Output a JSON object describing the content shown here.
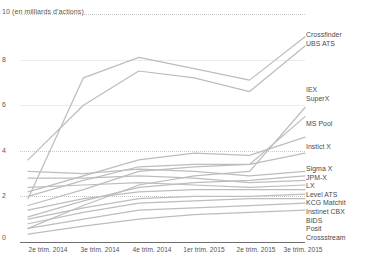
{
  "chart_data": {
    "type": "line",
    "title": "10 (en milliards d'actions)",
    "xlabel": "",
    "ylabel": "en milliards d'actions",
    "ylim": [
      0,
      10
    ],
    "yticks": [
      0,
      2,
      4,
      6,
      8,
      10
    ],
    "ytick_labels": [
      "0",
      "2",
      "4",
      "6",
      "8",
      "10 (en milliards d'actions)"
    ],
    "grid": true,
    "legend_position": "right",
    "categories": [
      "2e trim. 2014",
      "3e trim. 2014",
      "4e trim. 2014",
      "1er trim. 2015",
      "2e trim. 2015",
      "3e trim. 2015"
    ],
    "series": [
      {
        "name": "Crossfinder",
        "values": [
          1.9,
          7.2,
          8.1,
          7.6,
          7.1,
          9.0
        ]
      },
      {
        "name": "UBS ATS",
        "values": [
          3.6,
          6.0,
          7.5,
          7.2,
          6.6,
          8.6
        ]
      },
      {
        "name": "IEX",
        "values": [
          0.6,
          1.6,
          2.5,
          2.9,
          3.1,
          5.9
        ]
      },
      {
        "name": "SuperX",
        "values": [
          1.6,
          2.3,
          3.1,
          3.3,
          3.4,
          5.5
        ]
      },
      {
        "name": "MS Pool",
        "values": [
          2.2,
          2.9,
          3.6,
          3.9,
          3.8,
          4.6
        ]
      },
      {
        "name": "Instict X",
        "values": [
          2.0,
          2.7,
          3.3,
          3.4,
          3.4,
          3.9
        ]
      },
      {
        "name": "Sigma X",
        "values": [
          3.1,
          3.0,
          3.2,
          3.1,
          2.9,
          3.1
        ]
      },
      {
        "name": "JPM-X",
        "values": [
          1.1,
          1.8,
          2.4,
          2.6,
          2.7,
          2.9
        ]
      },
      {
        "name": "LX",
        "values": [
          2.8,
          2.8,
          2.9,
          2.8,
          2.6,
          2.7
        ]
      },
      {
        "name": "Level ATS",
        "values": [
          2.4,
          2.5,
          2.6,
          2.5,
          2.4,
          2.5
        ]
      },
      {
        "name": "KCG Matchit",
        "values": [
          1.4,
          1.9,
          2.2,
          2.3,
          2.3,
          2.3
        ]
      },
      {
        "name": "Instinet CBX",
        "values": [
          1.0,
          1.5,
          1.9,
          2.0,
          2.0,
          2.1
        ]
      },
      {
        "name": "BIDS",
        "values": [
          0.8,
          1.3,
          1.7,
          1.8,
          1.9,
          1.9
        ]
      },
      {
        "name": "Posit",
        "values": [
          0.6,
          1.0,
          1.4,
          1.5,
          1.6,
          1.7
        ]
      },
      {
        "name": "Crossstream",
        "values": [
          0.35,
          0.7,
          1.0,
          1.2,
          1.3,
          1.4
        ]
      }
    ],
    "line_color": "#bdbdbd"
  },
  "axis": {
    "y_title": "10 (en milliards d'actions)",
    "ticks": {
      "t8": "8",
      "t6": "6",
      "t4": "4",
      "t2": "2",
      "t0": "0"
    },
    "x": {
      "c0": "2e trim. 2014",
      "c1": "3e trim. 2014",
      "c2": "4e trim. 2014",
      "c3": "1er trim. 2015",
      "c4": "2e trim. 2015",
      "c5": "3e trim. 2015"
    }
  },
  "legend": {
    "top_group": {
      "l0": "Crossfinder",
      "l1": "UBS ATS"
    },
    "mid_group": {
      "l0": "IEX",
      "l1": "SuperX"
    },
    "ms_pool": "MS Pool",
    "instict_x": "Instict X",
    "bottom_group": {
      "l0": "Sigma X",
      "l1": "JPM-X",
      "l2": "LX",
      "l3": "Level ATS",
      "l4": "KCG Matchit",
      "l5": "Instinet CBX",
      "l6": "BIDS",
      "l7": "Posit",
      "l8": "Crossstream"
    }
  },
  "footer": {
    "source": ""
  }
}
